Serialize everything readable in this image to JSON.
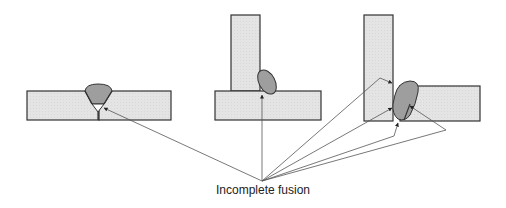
{
  "diagram": {
    "label": "Incomplete fusion",
    "colors": {
      "plate_fill": "#e4e4e4",
      "plate_stroke": "#333333",
      "weld_fill": "#9e9e9e",
      "leader_line": "#555555",
      "background": "#ffffff"
    },
    "joints": [
      {
        "id": "butt-joint",
        "type": "single-V butt weld",
        "defects": 1
      },
      {
        "id": "t-joint",
        "type": "fillet weld T-joint",
        "defects": 1
      },
      {
        "id": "corner-joint",
        "type": "double-sided corner/T weld",
        "defects": 4
      }
    ],
    "leader_origin": {
      "x": 262,
      "y": 181
    }
  }
}
